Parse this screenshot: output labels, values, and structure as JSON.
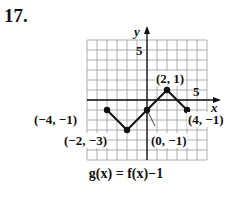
{
  "problem": {
    "number": "17."
  },
  "chart_data": {
    "type": "line",
    "title": "g(x) = f(x)−1",
    "xlabel": "x",
    "ylabel": "y",
    "xlim": [
      -6,
      6
    ],
    "ylim": [
      -6,
      6
    ],
    "grid": true,
    "tick_labels": {
      "x": [
        "5"
      ],
      "y": [
        "5"
      ]
    },
    "x": [
      -4,
      -2,
      0,
      2,
      4
    ],
    "y": [
      -1,
      -3,
      -1,
      1,
      -1
    ],
    "points": [
      {
        "x": -4,
        "y": -1,
        "label": "(−4, −1)"
      },
      {
        "x": -2,
        "y": -3,
        "label": "(−2, −3)"
      },
      {
        "x": 0,
        "y": -1,
        "label": "(0, −1)"
      },
      {
        "x": 2,
        "y": 1,
        "label": "(2, 1)"
      },
      {
        "x": 4,
        "y": -1,
        "label": "(4, −1)"
      }
    ]
  },
  "caption": "g(x) = f(x)−1"
}
